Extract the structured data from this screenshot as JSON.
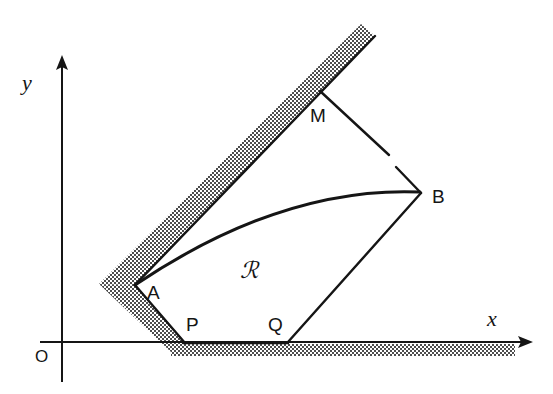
{
  "figure": {
    "background_color": "#ffffff",
    "ink_color": "#151515",
    "hatch_color": "#4a4a4a",
    "width": 553,
    "height": 394
  },
  "axes": {
    "x_label": "x",
    "y_label": "y",
    "origin_label": "O",
    "x_axis": {
      "from_x": 40,
      "from_y": 342,
      "to_x": 530,
      "to_y": 342,
      "arrow": true
    },
    "y_axis": {
      "from_x": 62,
      "from_y": 380,
      "to_x": 62,
      "to_y": 56,
      "arrow": true
    }
  },
  "points": {
    "A": {
      "label": "A",
      "x": 135,
      "y": 285,
      "label_x": 147,
      "label_y": 283
    },
    "B": {
      "label": "B",
      "x": 420,
      "y": 192,
      "label_x": 432,
      "label_y": 187
    },
    "M": {
      "label": "M",
      "x": 320,
      "y": 91,
      "label_x": 310,
      "label_y": 106
    },
    "P": {
      "label": "P",
      "x": 185,
      "y": 342,
      "label_x": 186,
      "label_y": 315
    },
    "Q": {
      "label": "Q",
      "x": 288,
      "y": 342,
      "label_x": 268,
      "label_y": 315
    }
  },
  "region": {
    "label": "ℛ",
    "label_x": 240,
    "label_y": 259
  },
  "segments": [
    {
      "name": "ray-A-to-M-extended",
      "x1": 135,
      "y1": 285,
      "x2": 375,
      "y2": 36
    },
    {
      "name": "segment-M-to-B-upper",
      "x1": 320,
      "y1": 91,
      "x2": 389,
      "y2": 155
    },
    {
      "name": "segment-M-to-B-lower",
      "x1": 396,
      "y1": 167,
      "x2": 420,
      "y2": 192
    },
    {
      "name": "segment-B-to-Q",
      "x1": 420,
      "y1": 192,
      "x2": 288,
      "y2": 342
    },
    {
      "name": "segment-Q-to-P",
      "x1": 288,
      "y1": 342,
      "x2": 185,
      "y2": 342
    },
    {
      "name": "segment-P-to-A",
      "x1": 185,
      "y1": 342,
      "x2": 135,
      "y2": 285
    }
  ],
  "curve": {
    "name": "arc-A-to-B",
    "start_x": 135,
    "start_y": 285,
    "control_x": 282,
    "control_y": 186,
    "end_x": 420,
    "end_y": 192
  },
  "hatched_bands": [
    {
      "name": "band-along-ray-A-M",
      "description": "shaded strip on the upper-left side of ray AM"
    },
    {
      "name": "band-along-segment-A-P",
      "description": "shaded strip on the lower-left side of segment AP"
    },
    {
      "name": "band-below-x-axis",
      "description": "shaded strip under the x-axis from P rightwards"
    }
  ]
}
